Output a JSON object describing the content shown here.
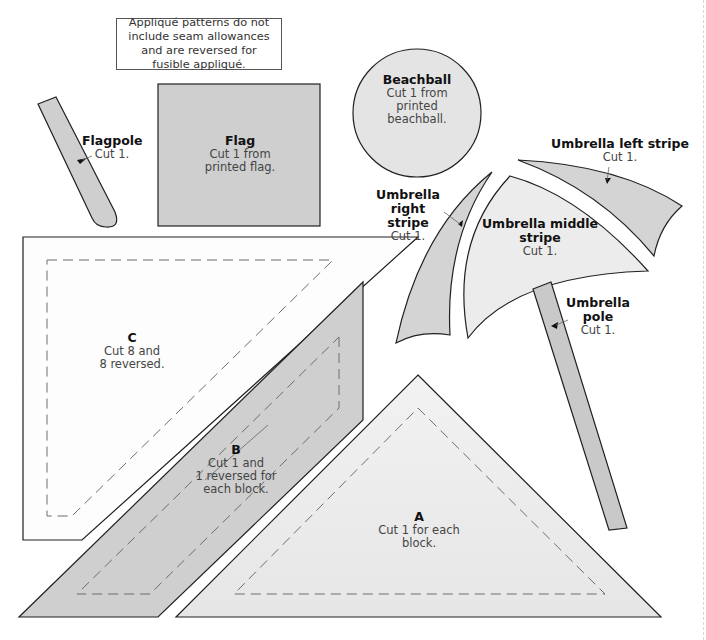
{
  "notice": {
    "text": "Appliqué patterns do not include seam allowances and are reversed for fusible appliqué."
  },
  "colors": {
    "outline": "#231f20",
    "dark_fill": "#cdcdcd",
    "light_fill": "#eeeeee",
    "dash": "#6d6d6d",
    "background": "#ffffff"
  },
  "pieces": {
    "flagpole": {
      "title": "Flagpole",
      "instruction": "Cut 1."
    },
    "flag": {
      "title": "Flag",
      "instruction_line1": "Cut 1 from",
      "instruction_line2": "printed flag."
    },
    "beachball": {
      "title": "Beachball",
      "instruction_line1": "Cut 1 from",
      "instruction_line2": "printed",
      "instruction_line3": "beachball."
    },
    "umbrella_left_stripe": {
      "title": "Umbrella left stripe",
      "instruction": "Cut 1."
    },
    "umbrella_right_stripe": {
      "title_line1": "Umbrella right",
      "title_line2": "stripe",
      "instruction": "Cut 1."
    },
    "umbrella_middle_stripe": {
      "title_line1": "Umbrella middle",
      "title_line2": "stripe",
      "instruction": "Cut 1."
    },
    "umbrella_pole": {
      "title_line1": "Umbrella",
      "title_line2": "pole",
      "instruction": "Cut 1."
    },
    "c": {
      "title": "C",
      "instruction_line1": "Cut 8 and",
      "instruction_line2": "8 reversed."
    },
    "b": {
      "title": "B",
      "instruction_line1": "Cut 1 and",
      "instruction_line2": "1 reversed for",
      "instruction_line3": "each block."
    },
    "a": {
      "title": "A",
      "instruction": "Cut 1 for each block."
    }
  }
}
